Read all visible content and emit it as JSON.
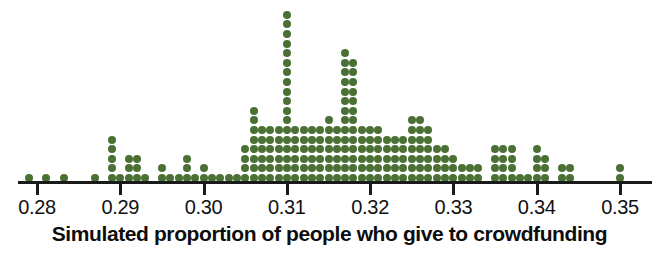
{
  "chart_data": {
    "type": "dotplot",
    "title": "",
    "xlabel": "Simulated proportion of people who give to crowdfunding",
    "ylabel": "",
    "xlim": [
      0.2775,
      0.3525
    ],
    "grid": false,
    "legend": null,
    "dot_color": "#4a7033",
    "axis_color": "#1a1a1a",
    "bin_width": 0.001,
    "tick_values": [
      0.28,
      0.29,
      0.3,
      0.31,
      0.32,
      0.33,
      0.34,
      0.35
    ],
    "tick_labels": [
      "0.28",
      "0.29",
      "0.30",
      "0.31",
      "0.32",
      "0.33",
      "0.34",
      "0.35"
    ],
    "x": [
      0.279,
      0.2811,
      0.2832,
      0.287,
      0.289,
      0.29,
      0.291,
      0.292,
      0.293,
      0.295,
      0.296,
      0.297,
      0.298,
      0.299,
      0.3,
      0.301,
      0.302,
      0.303,
      0.304,
      0.305,
      0.306,
      0.307,
      0.308,
      0.309,
      0.31,
      0.311,
      0.312,
      0.313,
      0.314,
      0.315,
      0.316,
      0.317,
      0.318,
      0.319,
      0.32,
      0.321,
      0.322,
      0.323,
      0.324,
      0.325,
      0.326,
      0.327,
      0.328,
      0.329,
      0.33,
      0.331,
      0.332,
      0.333,
      0.335,
      0.336,
      0.337,
      0.338,
      0.339,
      0.34,
      0.341,
      0.343,
      0.344,
      0.35
    ],
    "counts": [
      1,
      1,
      1,
      1,
      5,
      1,
      3,
      3,
      1,
      2,
      1,
      1,
      3,
      1,
      2,
      1,
      1,
      1,
      1,
      4,
      8,
      6,
      6,
      6,
      18,
      6,
      6,
      6,
      6,
      7,
      6,
      14,
      13,
      6,
      6,
      6,
      5,
      5,
      5,
      7,
      7,
      6,
      4,
      4,
      3,
      2,
      2,
      2,
      4,
      4,
      4,
      1,
      1,
      4,
      3,
      2,
      2,
      2
    ],
    "max_count": 18,
    "total_dots": 253
  },
  "axis": {
    "title": "Simulated proportion of people who give to crowdfunding"
  }
}
